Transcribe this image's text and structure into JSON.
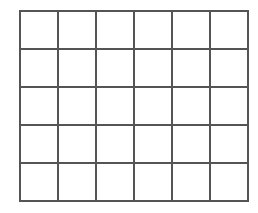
{
  "figure": {
    "label": "b)",
    "label_visible_fragment": ")",
    "grid": {
      "rows": 5,
      "columns": 6,
      "line_color": "#555555",
      "cell_fill": "#ffffff"
    }
  }
}
